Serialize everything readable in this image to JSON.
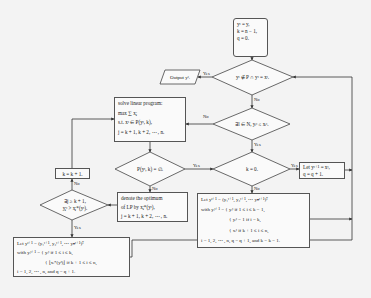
{
  "diagram": {
    "type": "flowchart",
    "nodes": {
      "start": {
        "lines": [
          "yᵗ = y,",
          "k = n − 1,",
          "q = 0."
        ]
      },
      "decision_feasible": {
        "text": "yᵗ ∉ P ∩ yᵗ = xᵗ."
      },
      "output": {
        "text": "Output yᵗ."
      },
      "decision_exists_l": {
        "text": "∃l ∈ N, yₗᵗ ≤ xₗᵗ."
      },
      "solve_lp": {
        "lines": [
          "solve linear program:",
          "max  ∑ xⱼ",
          "s.t. xᵗ ∈ P(yᵗ, k),",
          "j = k + 1, k + 2, ⋯ , n."
        ]
      },
      "decision_empty": {
        "text": "P(yᵗ, k) = ∅."
      },
      "decision_k_zero": {
        "text": "k = 0."
      },
      "let_right": {
        "lines": [
          "Let yᵗ⁺¹ = xᵗ,",
          "q = q + 1."
        ]
      },
      "k_increment": {
        "text": "k = k + 1."
      },
      "decision_exists_j": {
        "lines": [
          "∃j ≥ k + 1,",
          "yⱼᵗ > xⱼ*(yᵗ)."
        ]
      },
      "denote": {
        "lines": [
          "denote the optimum",
          "of LP by xⱼ*(yᵗ),",
          "j = k + 1, k + 2, ⋯ , n."
        ]
      },
      "let_bottom_right": {
        "lines": [
          "Let yᵗ⁺¹ = (y₁ᵗ⁺¹, y₂ᵗ⁺¹, ⋯ yₙᵗ⁺¹)ᵀ",
          "with yᵢᵗ⁺¹ = { yᵢᵗ      if 1 ≤ i ≤ k − 1,",
          "{ yᵢᵗ − 1 if i = k,",
          "{ xᵢᵗ      if k + 1 ≤ i ≤ n,",
          "i = 1, 2, ⋯ , n, q = q + 1, and k = k − 1."
        ]
      },
      "let_bottom_left": {
        "lines": [
          "Let yᵗ⁺¹ = (y₁ᵗ⁺¹, y₂ᵗ⁺¹, ⋯ yₙᵗ⁺¹)ᵀ",
          "with yᵢᵗ⁺¹ = { yᵢᵗ              if 1 ≤ i ≤ k,",
          "{ ⌊xᵢ*(yᵗ)⌋  if k + 1 ≤ i ≤ n,",
          "i = 1, 2, ⋯ , n, and q = q + 1."
        ]
      }
    },
    "edge_labels": {
      "yes": "Yes",
      "no": "No"
    }
  },
  "colors": {
    "line": "#333333",
    "box_fill": "#fafafa",
    "background": "#f3f3f3"
  }
}
